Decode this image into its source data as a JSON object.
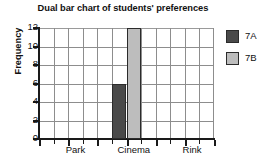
{
  "chart_data": {
    "type": "bar",
    "title": "Dual bar chart of students' preferences",
    "xlabel": "",
    "ylabel": "Frequency",
    "categories": [
      "Park",
      "Cinema",
      "Rink"
    ],
    "series": [
      {
        "name": "7A",
        "color": "#4a4a4a",
        "values": [
          0,
          6,
          0
        ]
      },
      {
        "name": "7B",
        "color": "#bdbdbd",
        "values": [
          0,
          12,
          0
        ]
      }
    ],
    "ylim": [
      0,
      12
    ],
    "ytick_step": 2,
    "yticks": [
      "0",
      "2",
      "4",
      "6",
      "8",
      "10",
      "12"
    ],
    "grid": true,
    "grid_columns": 12,
    "legend_position": "right",
    "legend": [
      "7A",
      "7B"
    ]
  },
  "axis": {
    "y_title": "Frequency"
  }
}
